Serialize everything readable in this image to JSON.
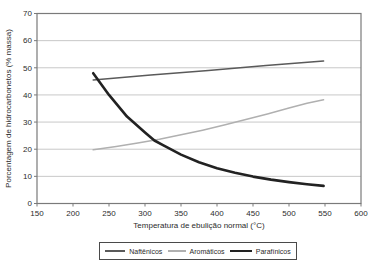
{
  "figure": {
    "background_color": "#ffffff",
    "frame_color": "#7a7a7a",
    "gridline_color": "#c8c8c8",
    "text_color": "#2b2b2b"
  },
  "chart_data": {
    "type": "line",
    "title": "",
    "xlabel": "Temperatura de ebulição normal (°C)",
    "ylabel": "Porcentagem de hidrocarbonetos (% massa)",
    "xlim": [
      150,
      600
    ],
    "ylim": [
      0,
      70
    ],
    "xticks": [
      150,
      200,
      250,
      300,
      350,
      400,
      450,
      500,
      550,
      600
    ],
    "yticks": [
      0,
      10,
      20,
      30,
      40,
      50,
      60,
      70
    ],
    "grid": "horizontal-only",
    "legend_position": "bottom-center-boxed",
    "series": [
      {
        "name": "Naftênicos",
        "color": "#5a5a5a",
        "stroke_width": 1.5,
        "legend_sample_width": 20,
        "points": [
          [
            228,
            45.5
          ],
          [
            308,
            47.3
          ],
          [
            388,
            49.0
          ],
          [
            468,
            50.8
          ],
          [
            548,
            52.5
          ]
        ]
      },
      {
        "name": "Aromáticos",
        "color": "#b0b0b0",
        "stroke_width": 1.5,
        "legend_sample_width": 18,
        "points": [
          [
            228,
            19.8
          ],
          [
            260,
            21.0
          ],
          [
            290,
            22.3
          ],
          [
            320,
            23.7
          ],
          [
            350,
            25.3
          ],
          [
            380,
            27.0
          ],
          [
            410,
            28.9
          ],
          [
            440,
            30.9
          ],
          [
            470,
            33.0
          ],
          [
            500,
            35.2
          ],
          [
            525,
            36.9
          ],
          [
            548,
            38.2
          ]
        ]
      },
      {
        "name": "Parafínicos",
        "color": "#222222",
        "stroke_width": 2.6,
        "legend_sample_width": 22,
        "points": [
          [
            228,
            48.0
          ],
          [
            250,
            40.0
          ],
          [
            275,
            32.0
          ],
          [
            300,
            26.2
          ],
          [
            313,
            23.2
          ],
          [
            325,
            21.5
          ],
          [
            350,
            18.0
          ],
          [
            375,
            15.2
          ],
          [
            400,
            13.0
          ],
          [
            425,
            11.3
          ],
          [
            450,
            9.9
          ],
          [
            475,
            8.8
          ],
          [
            500,
            7.9
          ],
          [
            525,
            7.1
          ],
          [
            548,
            6.5
          ]
        ]
      }
    ]
  }
}
